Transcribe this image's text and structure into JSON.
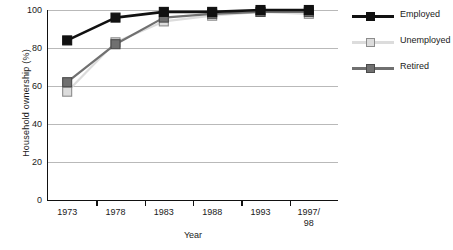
{
  "chart_data": {
    "type": "line",
    "title": "",
    "xlabel": "Year",
    "ylabel": "Household ownership (%)",
    "categories": [
      "1973",
      "1978",
      "1983",
      "1988",
      "1993",
      "1997/\n98"
    ],
    "category_labels": [
      "1973",
      "1978",
      "1983",
      "1988",
      "1993",
      "1997/ 98"
    ],
    "ylim": [
      0,
      100
    ],
    "yticks": [
      0,
      20,
      40,
      60,
      80,
      100
    ],
    "ytick_labels": [
      "0",
      "20",
      "40",
      "60",
      "80",
      "100"
    ],
    "grid": true,
    "grid_axis": "y",
    "legend_position": "right",
    "series": [
      {
        "name": "Employed",
        "color": "#111111",
        "marker_fill": "#111111",
        "marker_edge": "#111111",
        "values": [
          84,
          96,
          99,
          99,
          100,
          100
        ]
      },
      {
        "name": "Unemployed",
        "color": "#dcdcdc",
        "marker_fill": "#dcdcdc",
        "marker_edge": "#8c8c8c",
        "values": [
          57,
          83,
          94,
          97,
          99,
          98
        ]
      },
      {
        "name": "Retired",
        "color": "#707070",
        "marker_fill": "#707070",
        "marker_edge": "#4a4a4a",
        "values": [
          62,
          82,
          96,
          98,
          99,
          99
        ]
      }
    ]
  },
  "axes": {
    "y_title": "Household ownership (%)",
    "x_title": "Year"
  },
  "legend": {
    "items": [
      {
        "label": "Employed"
      },
      {
        "label": "Unemployed"
      },
      {
        "label": "Retired"
      }
    ]
  },
  "colors": {
    "background": "#ffffff",
    "axis": "#111111",
    "gridline": "#b9b9b9",
    "text": "#1a1a1a",
    "employed": "#111111",
    "unemployed": "#dcdcdc",
    "retired": "#707070"
  }
}
